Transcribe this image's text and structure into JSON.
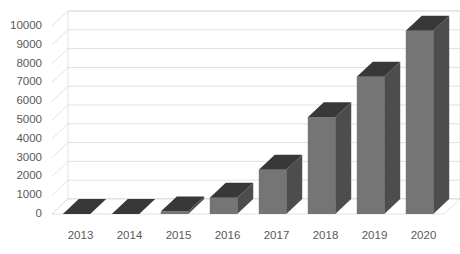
{
  "chart_data": {
    "type": "bar",
    "title": "",
    "subtitle": "",
    "xlabel": "",
    "ylabel": "",
    "categories": [
      "2013",
      "2014",
      "2015",
      "2016",
      "2017",
      "2018",
      "2019",
      "2020"
    ],
    "values": [
      0,
      0,
      130,
      870,
      2350,
      5150,
      7300,
      9750
    ],
    "series": [
      {
        "name": "",
        "values": [
          0,
          0,
          130,
          870,
          2350,
          5150,
          7300,
          9750
        ]
      }
    ],
    "ylim": [
      0,
      10000
    ],
    "ytick_labels": [
      "0",
      "1000",
      "2000",
      "3000",
      "4000",
      "5000",
      "6000",
      "7000",
      "8000",
      "9000",
      "10000"
    ],
    "ytick_values": [
      0,
      1000,
      2000,
      3000,
      4000,
      5000,
      6000,
      7000,
      8000,
      9000,
      10000
    ],
    "grid": true,
    "grid_axis": "y",
    "legend": false,
    "legend_position": "none",
    "three_d": true,
    "data_labels": false,
    "annotations": []
  },
  "style": {
    "bar_face_color": "#757575",
    "bar_side_color": "#4d4d4d",
    "bar_top_color": "#383838",
    "grid_color": "#d9d9d9",
    "wall_color": "#ffffff",
    "wall_edge_color": "#d9d9d9",
    "floor_color": "#ffffff",
    "tick_text_color": "#595959",
    "background_color": "#ffffff"
  }
}
